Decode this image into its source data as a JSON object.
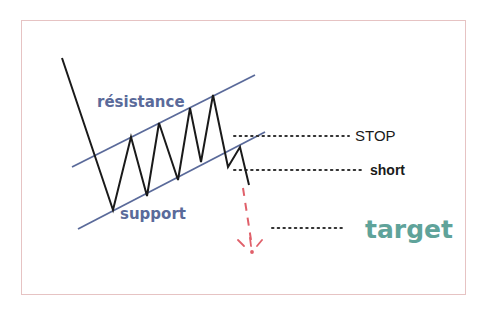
{
  "diagram": {
    "colors": {
      "frame": "#e6c3c3",
      "channel_lines": "#5a6a9a",
      "price_path": "#1a1a1a",
      "projection": "#e0606a",
      "dotted_guides": "#333333",
      "target_text": "#5fa39a"
    },
    "labels": {
      "resistance": "résistance",
      "support": "support",
      "stop": "STOP",
      "short": "short",
      "target": "target"
    },
    "channel": {
      "resistance_line": [
        [
          72,
          167
        ],
        [
          255,
          75
        ]
      ],
      "support_line": [
        [
          78,
          229
        ],
        [
          265,
          132
        ]
      ]
    },
    "price_path": [
      [
        62,
        58
      ],
      [
        113,
        210
      ],
      [
        131,
        137
      ],
      [
        147,
        196
      ],
      [
        159,
        123
      ],
      [
        178,
        180
      ],
      [
        190,
        108
      ],
      [
        201,
        162
      ],
      [
        213,
        95
      ],
      [
        228,
        167
      ],
      [
        240,
        147
      ],
      [
        249,
        185
      ]
    ],
    "projection": {
      "from": [
        243,
        187
      ],
      "to": [
        252,
        248
      ]
    },
    "guides": {
      "stop": {
        "y": 136,
        "x1": 234,
        "x2": 349
      },
      "short": {
        "y": 170,
        "x1": 234,
        "x2": 362
      },
      "target": {
        "y": 228,
        "x1": 272,
        "x2": 344
      }
    }
  }
}
